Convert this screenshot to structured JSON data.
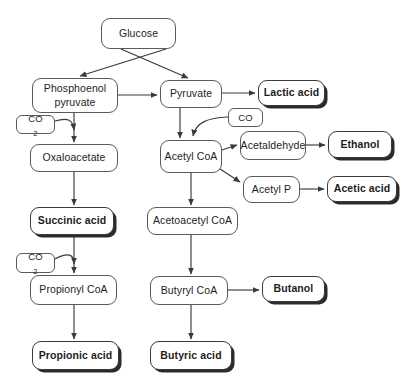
{
  "diagram": {
    "type": "flowchart",
    "canvas": {
      "width": 408,
      "height": 381
    },
    "style": {
      "background": "#ffffff",
      "node_border": "#5a5a5a",
      "node_fill": "#ffffff",
      "text_color": "#1d1d1d",
      "edge_color": "#3a3a3a",
      "shadow_color": "#2b2b2b"
    },
    "nodes": [
      {
        "id": "glucose",
        "label": "Glucose",
        "emphasis": "normal",
        "x": 101,
        "y": 18,
        "w": 75,
        "h": 31
      },
      {
        "id": "pep",
        "label": "Phosphoenol\npyruvate",
        "line1": "Phosphoenol",
        "line2": "pyruvate",
        "emphasis": "normal",
        "x": 32,
        "y": 78,
        "w": 86,
        "h": 35
      },
      {
        "id": "pyruvate",
        "label": "Pyruvate",
        "emphasis": "normal",
        "x": 160,
        "y": 80,
        "w": 62,
        "h": 28
      },
      {
        "id": "lactic_acid",
        "label": "Lactic acid",
        "emphasis": "bold",
        "x": 258,
        "y": 80,
        "w": 67,
        "h": 26
      },
      {
        "id": "co2_top",
        "label": "CO2",
        "text": "CO",
        "sub": "2",
        "emphasis": "small",
        "x": 16,
        "y": 115,
        "w": 39,
        "h": 19
      },
      {
        "id": "co",
        "label": "CO",
        "emphasis": "small",
        "x": 228,
        "y": 108,
        "w": 35,
        "h": 19
      },
      {
        "id": "oxaloacetate",
        "label": "Oxaloacetate",
        "emphasis": "normal",
        "x": 30,
        "y": 144,
        "w": 88,
        "h": 28
      },
      {
        "id": "acetyl_coa",
        "label": "Acetyl  CoA",
        "emphasis": "normal",
        "x": 160,
        "y": 140,
        "w": 62,
        "h": 33
      },
      {
        "id": "acetaldehyde",
        "label": "Acetaldehyde",
        "emphasis": "normal",
        "x": 240,
        "y": 131,
        "w": 66,
        "h": 29
      },
      {
        "id": "ethanol",
        "label": "Ethanol",
        "emphasis": "bold",
        "x": 328,
        "y": 131,
        "w": 64,
        "h": 27
      },
      {
        "id": "acetyl_p",
        "label": "Acetyl P",
        "emphasis": "normal",
        "x": 243,
        "y": 176,
        "w": 57,
        "h": 27
      },
      {
        "id": "acetic_acid",
        "label": "Acetic acid",
        "emphasis": "bold",
        "x": 327,
        "y": 176,
        "w": 70,
        "h": 26
      },
      {
        "id": "succinic_acid",
        "label": "Succinic acid",
        "emphasis": "bold",
        "x": 30,
        "y": 207,
        "w": 84,
        "h": 28
      },
      {
        "id": "acetoacetyl_coa",
        "label": "Acetoacetyl CoA",
        "emphasis": "normal",
        "x": 147,
        "y": 207,
        "w": 91,
        "h": 28
      },
      {
        "id": "co2_bottom",
        "label": "CO2",
        "text": "CO",
        "sub": "2",
        "emphasis": "small",
        "x": 16,
        "y": 253,
        "w": 39,
        "h": 20
      },
      {
        "id": "propionyl_coa",
        "label": "Propionyl CoA",
        "emphasis": "normal",
        "x": 30,
        "y": 275,
        "w": 87,
        "h": 30
      },
      {
        "id": "butyryl_coa",
        "label": "Butyryl CoA",
        "emphasis": "normal",
        "x": 150,
        "y": 276,
        "w": 78,
        "h": 29
      },
      {
        "id": "butanol",
        "label": "Butanol",
        "emphasis": "bold",
        "x": 262,
        "y": 276,
        "w": 63,
        "h": 26
      },
      {
        "id": "propionic_acid",
        "label": "Propionic acid",
        "emphasis": "bold",
        "x": 32,
        "y": 341,
        "w": 87,
        "h": 29
      },
      {
        "id": "butyric_acid",
        "label": "Butyric acid",
        "emphasis": "bold",
        "x": 150,
        "y": 341,
        "w": 82,
        "h": 29
      }
    ],
    "edges": [
      {
        "from": "glucose",
        "to": "pep",
        "kind": "straight"
      },
      {
        "from": "glucose",
        "to": "pyruvate",
        "kind": "straight"
      },
      {
        "from": "pep",
        "to": "pyruvate",
        "kind": "straight"
      },
      {
        "from": "pep",
        "to": "oxaloacetate",
        "kind": "straight"
      },
      {
        "from": "co2_top",
        "to": "oxaloacetate",
        "kind": "curved"
      },
      {
        "from": "pyruvate",
        "to": "lactic_acid",
        "kind": "straight"
      },
      {
        "from": "pyruvate",
        "to": "acetyl_coa",
        "kind": "straight"
      },
      {
        "from": "co",
        "to": "acetyl_coa",
        "kind": "curved"
      },
      {
        "from": "acetyl_coa",
        "to": "acetaldehyde",
        "kind": "straight"
      },
      {
        "from": "acetaldehyde",
        "to": "ethanol",
        "kind": "straight"
      },
      {
        "from": "acetyl_coa",
        "to": "acetyl_p",
        "kind": "straight"
      },
      {
        "from": "acetyl_p",
        "to": "acetic_acid",
        "kind": "straight"
      },
      {
        "from": "oxaloacetate",
        "to": "succinic_acid",
        "kind": "straight"
      },
      {
        "from": "acetyl_coa",
        "to": "acetoacetyl_coa",
        "kind": "straight"
      },
      {
        "from": "succinic_acid",
        "to": "propionyl_coa",
        "kind": "straight"
      },
      {
        "from": "co2_bottom",
        "to": "propionyl_coa",
        "kind": "curved"
      },
      {
        "from": "acetoacetyl_coa",
        "to": "butyryl_coa",
        "kind": "straight"
      },
      {
        "from": "butyryl_coa",
        "to": "butanol",
        "kind": "straight"
      },
      {
        "from": "butyryl_coa",
        "to": "butyric_acid",
        "kind": "straight"
      },
      {
        "from": "propionyl_coa",
        "to": "propionic_acid",
        "kind": "straight"
      }
    ]
  }
}
